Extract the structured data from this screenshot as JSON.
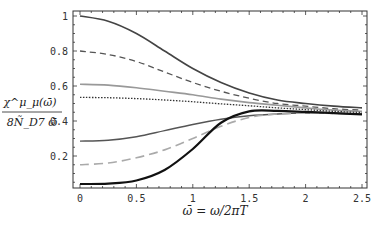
{
  "chart_data": {
    "type": "line",
    "title": "",
    "xlabel": "ω̄ = ω/2πT",
    "ylabel": "χ^μ_μ(ω̄) / 8 Ñ_D7 ω̄",
    "ylabel_num": "χ^μ_μ(ω̄)",
    "ylabel_den": "8Ñ_D7 ω̄",
    "xlim": [
      0,
      2.5
    ],
    "ylim": [
      0.03,
      1.03
    ],
    "xticks": [
      "0",
      "0.5",
      "1",
      "1.5",
      "2",
      "2.5"
    ],
    "yticks": [
      "0.2",
      "0.4",
      "0.6",
      "0.8",
      "1"
    ],
    "grid": false,
    "legend": "none",
    "x": [
      0,
      0.25,
      0.5,
      0.75,
      1.0,
      1.25,
      1.5,
      1.75,
      2.0,
      2.25,
      2.5
    ],
    "series": [
      {
        "name": "curve-1 dark solid",
        "style": "solid",
        "color": "#444444",
        "width": 1.6,
        "values": [
          1.0,
          0.97,
          0.9,
          0.8,
          0.7,
          0.62,
          0.56,
          0.52,
          0.5,
          0.485,
          0.475
        ]
      },
      {
        "name": "curve-2 dark dashed",
        "style": "dashed",
        "color": "#555555",
        "width": 1.3,
        "values": [
          0.8,
          0.78,
          0.74,
          0.68,
          0.62,
          0.57,
          0.53,
          0.5,
          0.485,
          0.47,
          0.462
        ]
      },
      {
        "name": "curve-3 light solid",
        "style": "solid",
        "color": "#999999",
        "width": 1.6,
        "values": [
          0.61,
          0.605,
          0.59,
          0.57,
          0.55,
          0.525,
          0.505,
          0.49,
          0.475,
          0.462,
          0.455
        ]
      },
      {
        "name": "curve-4 dotted",
        "style": "dotted",
        "color": "#333333",
        "width": 1.3,
        "values": [
          0.535,
          0.533,
          0.528,
          0.52,
          0.51,
          0.498,
          0.487,
          0.475,
          0.465,
          0.455,
          0.448
        ]
      },
      {
        "name": "curve-5 dark solid lower",
        "style": "solid",
        "color": "#555555",
        "width": 1.5,
        "values": [
          0.285,
          0.29,
          0.31,
          0.345,
          0.38,
          0.41,
          0.43,
          0.44,
          0.445,
          0.445,
          0.44
        ]
      },
      {
        "name": "curve-6 light dashed",
        "style": "dashed",
        "color": "#aaaaaa",
        "width": 1.6,
        "values": [
          0.15,
          0.16,
          0.19,
          0.235,
          0.3,
          0.37,
          0.42,
          0.44,
          0.445,
          0.443,
          0.44
        ]
      },
      {
        "name": "curve-7 black thick",
        "style": "solid",
        "color": "#111111",
        "width": 2.2,
        "values": [
          0.04,
          0.042,
          0.06,
          0.12,
          0.24,
          0.39,
          0.455,
          0.458,
          0.452,
          0.445,
          0.438
        ]
      }
    ]
  }
}
